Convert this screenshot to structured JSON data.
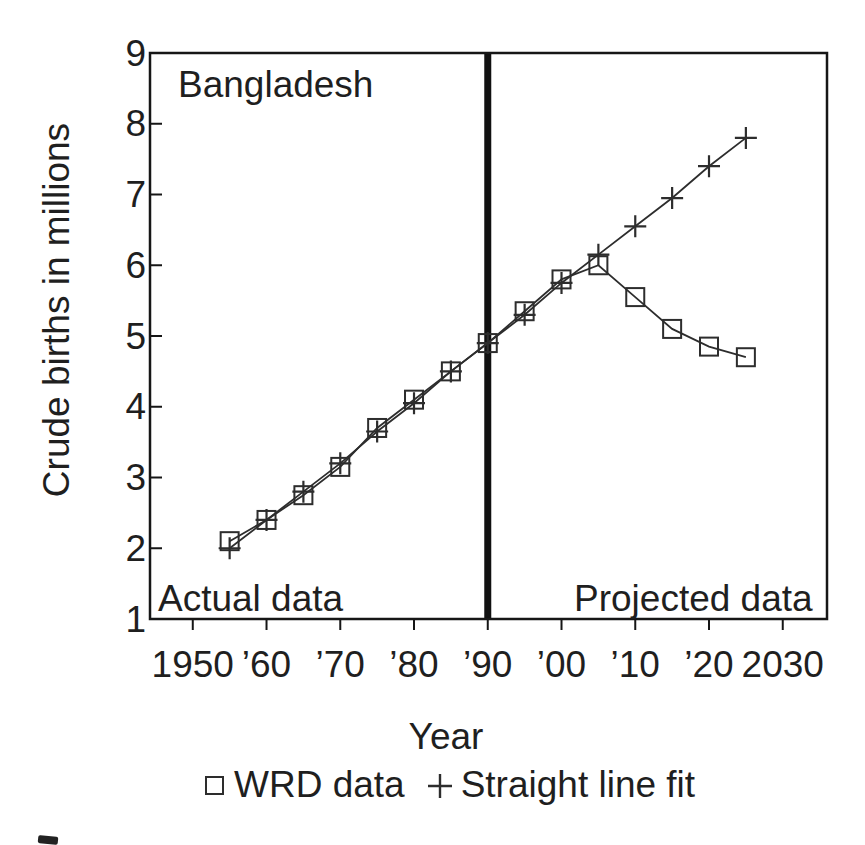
{
  "colors": {
    "ink": "#1f1f1f",
    "line": "#2d2d2d",
    "frame": "#161616",
    "divider": "#111111",
    "background": "#ffffff"
  },
  "chart_data": {
    "type": "line",
    "title": "Bangladesh",
    "xlabel": "Year",
    "ylabel": "Crude births in millions",
    "x": [
      1955,
      1960,
      1965,
      1970,
      1975,
      1980,
      1985,
      1990,
      1995,
      2000,
      2005,
      2010,
      2015,
      2020,
      2025
    ],
    "series": [
      {
        "name": "WRD data",
        "marker": "square",
        "values": [
          2.1,
          2.4,
          2.75,
          3.15,
          3.7,
          4.1,
          4.5,
          4.9,
          5.35,
          5.8,
          6.0,
          5.55,
          5.1,
          4.85,
          4.7
        ]
      },
      {
        "name": "Straight line fit",
        "marker": "plus",
        "values": [
          2.0,
          2.4,
          2.8,
          3.2,
          3.65,
          4.05,
          4.5,
          4.9,
          5.3,
          5.75,
          6.15,
          6.55,
          6.95,
          7.4,
          7.8
        ]
      }
    ],
    "xlim": [
      1944.2,
      2036.0
    ],
    "ylim": [
      1,
      9
    ],
    "xticks": [
      {
        "v": 1950,
        "label": "1950"
      },
      {
        "v": 1960,
        "label": "’60"
      },
      {
        "v": 1970,
        "label": "’70"
      },
      {
        "v": 1980,
        "label": "’80"
      },
      {
        "v": 1990,
        "label": "’90"
      },
      {
        "v": 2000,
        "label": "’00"
      },
      {
        "v": 2010,
        "label": "’10"
      },
      {
        "v": 2020,
        "label": "’20"
      },
      {
        "v": 2030,
        "label": "2030"
      }
    ],
    "yticks": [
      {
        "v": 1,
        "label": "1"
      },
      {
        "v": 2,
        "label": "2"
      },
      {
        "v": 3,
        "label": "3"
      },
      {
        "v": 4,
        "label": "4"
      },
      {
        "v": 5,
        "label": "5"
      },
      {
        "v": 6,
        "label": "6"
      },
      {
        "v": 7,
        "label": "7"
      },
      {
        "v": 8,
        "label": "8"
      },
      {
        "v": 9,
        "label": "9"
      }
    ],
    "divider": {
      "x": 1990
    },
    "annotations": [
      {
        "id": "region-left",
        "text": "Actual data"
      },
      {
        "id": "region-right",
        "text": "Projected data"
      }
    ],
    "grid": false,
    "legend_position": "bottom"
  }
}
